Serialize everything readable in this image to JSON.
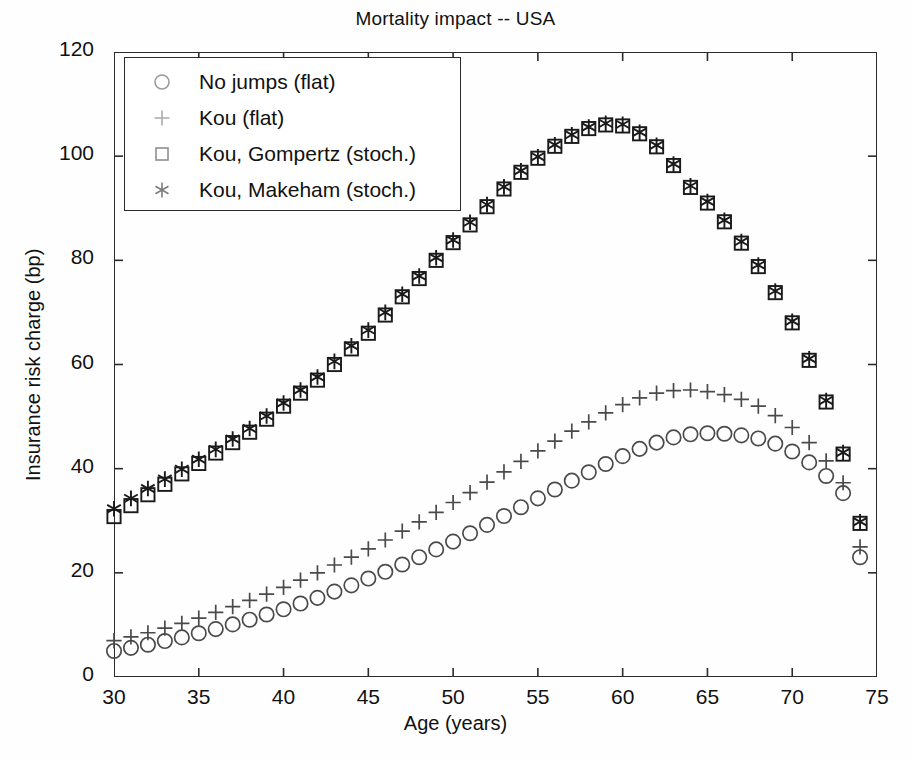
{
  "chart_data": {
    "type": "scatter",
    "title": "Mortality impact -- USA",
    "xlabel": "Age (years)",
    "ylabel": "Insurance risk charge (bp)",
    "xlim": [
      30,
      75
    ],
    "ylim": [
      0,
      120
    ],
    "xticks": [
      30,
      35,
      40,
      45,
      50,
      55,
      60,
      65,
      70,
      75
    ],
    "yticks": [
      0,
      20,
      40,
      60,
      80,
      100,
      120
    ],
    "grid": false,
    "legend_position": "upper left",
    "x": [
      30,
      31,
      32,
      33,
      34,
      35,
      36,
      37,
      38,
      39,
      40,
      41,
      42,
      43,
      44,
      45,
      46,
      47,
      48,
      49,
      50,
      51,
      52,
      53,
      54,
      55,
      56,
      57,
      58,
      59,
      60,
      61,
      62,
      63,
      64,
      65,
      66,
      67,
      68,
      69,
      70,
      71,
      72,
      73,
      74
    ],
    "series": [
      {
        "name": "No jumps (flat)",
        "marker": "circle",
        "values": [
          5.0,
          5.6,
          6.2,
          6.9,
          7.6,
          8.4,
          9.2,
          10.1,
          11.0,
          12.0,
          13.0,
          14.1,
          15.2,
          16.4,
          17.6,
          18.9,
          20.2,
          21.6,
          23.0,
          24.5,
          26.0,
          27.6,
          29.2,
          30.9,
          32.6,
          34.3,
          36.0,
          37.7,
          39.3,
          40.9,
          42.4,
          43.8,
          45.0,
          46.0,
          46.6,
          46.8,
          46.7,
          46.4,
          45.8,
          44.8,
          43.3,
          41.2,
          38.6,
          35.3,
          23.0
        ]
      },
      {
        "name": "Kou (flat)",
        "marker": "plus",
        "values": [
          7.0,
          7.7,
          8.5,
          9.4,
          10.3,
          11.3,
          12.4,
          13.5,
          14.7,
          15.9,
          17.2,
          18.6,
          20.0,
          21.5,
          23.0,
          24.6,
          26.3,
          28.0,
          29.8,
          31.6,
          33.5,
          35.4,
          37.4,
          39.4,
          41.4,
          43.4,
          45.3,
          47.2,
          49.0,
          50.7,
          52.3,
          53.6,
          54.5,
          55.0,
          55.1,
          54.8,
          54.2,
          53.3,
          52.0,
          50.2,
          47.9,
          45.0,
          41.5,
          37.3,
          25.0
        ]
      },
      {
        "name": "Kou, Gompertz (stoch.)",
        "marker": "square",
        "values": [
          30.8,
          32.9,
          35.0,
          37.0,
          39.0,
          41.0,
          43.0,
          45.0,
          47.0,
          49.5,
          52.0,
          54.5,
          57.0,
          60.0,
          63.0,
          66.0,
          69.5,
          73.0,
          76.5,
          80.0,
          83.4,
          86.8,
          90.3,
          93.7,
          96.9,
          99.6,
          101.9,
          103.8,
          105.3,
          106.0,
          105.8,
          104.3,
          101.8,
          98.2,
          94.0,
          91.0,
          87.4,
          83.3,
          78.8,
          73.8,
          68.0,
          60.8,
          52.8,
          42.8,
          29.5
        ]
      },
      {
        "name": "Kou, Makeham (stoch.)",
        "marker": "asterisk",
        "values": [
          32.3,
          34.3,
          36.2,
          38.0,
          39.9,
          41.8,
          43.7,
          45.7,
          47.7,
          50.1,
          52.6,
          55.1,
          57.6,
          60.6,
          63.6,
          66.6,
          70.0,
          73.5,
          77.0,
          80.5,
          83.9,
          87.3,
          90.7,
          94.1,
          97.2,
          99.9,
          102.2,
          104.1,
          105.6,
          106.3,
          106.1,
          104.6,
          102.1,
          98.5,
          94.3,
          91.3,
          87.7,
          83.6,
          79.1,
          74.1,
          68.3,
          61.1,
          53.1,
          43.1,
          29.8
        ]
      }
    ]
  },
  "legend": {
    "items": [
      {
        "label": "No jumps (flat)",
        "marker": "circle"
      },
      {
        "label": "Kou (flat)",
        "marker": "plus"
      },
      {
        "label": "Kou, Gompertz (stoch.)",
        "marker": "square"
      },
      {
        "label": "Kou, Makeham (stoch.)",
        "marker": "asterisk"
      }
    ]
  },
  "colors": {
    "axis": "#2b2b2b",
    "marker": "#1a1a1a",
    "legend_marker": "#9a9a9a",
    "background": "#ffffff"
  }
}
